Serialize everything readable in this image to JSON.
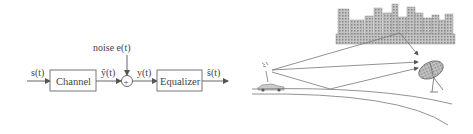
{
  "block_diagram": {
    "input_label": "s(t)",
    "channel_label": "Channel",
    "channel_output_label": "ŷ(t)",
    "noise_label": "noise  e(t)",
    "sum_symbol": "+",
    "sum_output_label": "y(t)",
    "equalizer_label": "Equalizer",
    "output_label": "ŝ(t)"
  },
  "illustration": {
    "description": "Multipath propagation: transmitter car signals reflected by city buildings and ground to satellite dish",
    "elements": [
      "car-antenna",
      "city-skyline",
      "satellite-dish",
      "road"
    ]
  },
  "colors": {
    "line": "#666666",
    "text": "#444444",
    "building_fill": "#b8b8b8"
  }
}
